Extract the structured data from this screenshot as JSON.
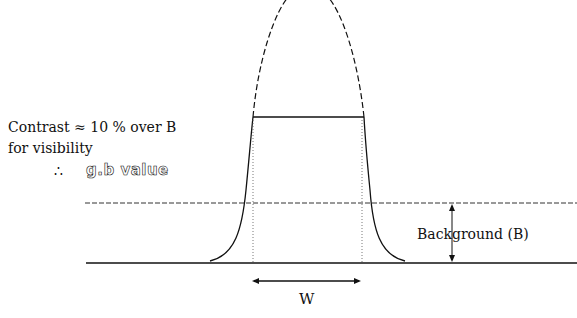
{
  "diagram": {
    "labels": {
      "contrast": "Contrast ≈ 10 %  over B",
      "visibility": "for visibility",
      "therefore": "∴",
      "gb_value": "g.b value",
      "background": "Background (B)",
      "width": "W"
    },
    "elements": [
      "gaussian-dashed-peak",
      "clipped-top-plateau",
      "background-dashed-line",
      "baseline",
      "width-arrow",
      "background-arrow"
    ],
    "colors": {
      "line": "#111111",
      "background": "#ffffff"
    }
  }
}
